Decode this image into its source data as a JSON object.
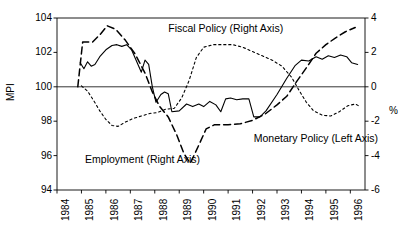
{
  "chart_data": {
    "type": "line",
    "title": "",
    "xlabel": "",
    "ylabel_left": "MPI",
    "ylabel_right": "%",
    "grid": false,
    "zero_reference_line": 100,
    "legend_position": "inline-annotations",
    "x": [
      1984,
      1985,
      1986,
      1987,
      1988,
      1989,
      1990,
      1991,
      1992,
      1993,
      1994,
      1995,
      1996
    ],
    "xtick_labels": [
      "1984",
      "1985",
      "1986",
      "1987",
      "1988",
      "1989",
      "1990",
      "1991",
      "1992",
      "1993",
      "1994",
      "1995",
      "1996"
    ],
    "left_axis": {
      "label": "MPI",
      "ylim": [
        94,
        104
      ],
      "ticks": [
        94,
        96,
        98,
        100,
        102,
        104
      ],
      "tick_labels": [
        "94",
        "96",
        "98",
        "100",
        "102",
        "104"
      ]
    },
    "right_axis": {
      "label": "%",
      "ylim": [
        -6,
        4
      ],
      "ticks": [
        -6,
        -4,
        -2,
        0,
        2,
        4
      ],
      "tick_labels": [
        "-6",
        "-4",
        "-2",
        "0",
        "2",
        "4"
      ]
    },
    "series": [
      {
        "name": "Monetary Policy (Left Axis)",
        "axis": "left",
        "style": "solid",
        "label_x": 1992.05,
        "label_y": 96.95,
        "points": [
          [
            1984.95,
            101.4
          ],
          [
            1985.1,
            101.05
          ],
          [
            1985.25,
            101.45
          ],
          [
            1985.4,
            101.2
          ],
          [
            1985.55,
            101.3
          ],
          [
            1985.75,
            101.75
          ],
          [
            1986.0,
            102.15
          ],
          [
            1986.25,
            102.4
          ],
          [
            1986.45,
            102.45
          ],
          [
            1986.65,
            102.35
          ],
          [
            1986.85,
            102.45
          ],
          [
            1987.05,
            102.15
          ],
          [
            1987.25,
            101.5
          ],
          [
            1987.45,
            100.85
          ],
          [
            1987.6,
            101.55
          ],
          [
            1987.75,
            101.3
          ],
          [
            1987.9,
            100.0
          ],
          [
            1988.05,
            99.1
          ],
          [
            1988.25,
            99.55
          ],
          [
            1988.4,
            99.7
          ],
          [
            1988.55,
            99.6
          ],
          [
            1988.7,
            98.55
          ],
          [
            1989.0,
            98.6
          ],
          [
            1989.3,
            99.0
          ],
          [
            1989.55,
            98.85
          ],
          [
            1989.8,
            99.0
          ],
          [
            1990.0,
            98.85
          ],
          [
            1990.25,
            99.15
          ],
          [
            1990.5,
            98.95
          ],
          [
            1990.7,
            98.55
          ],
          [
            1990.9,
            99.3
          ],
          [
            1991.1,
            99.35
          ],
          [
            1991.35,
            99.25
          ],
          [
            1991.6,
            99.3
          ],
          [
            1991.85,
            99.3
          ],
          [
            1992.05,
            98.25
          ],
          [
            1992.3,
            98.25
          ],
          [
            1992.55,
            98.6
          ],
          [
            1993.0,
            99.55
          ],
          [
            1993.4,
            100.5
          ],
          [
            1993.75,
            101.25
          ],
          [
            1994.0,
            101.55
          ],
          [
            1994.3,
            101.5
          ],
          [
            1994.6,
            101.75
          ],
          [
            1994.85,
            101.6
          ],
          [
            1995.1,
            101.8
          ],
          [
            1995.35,
            101.7
          ],
          [
            1995.6,
            101.85
          ],
          [
            1995.85,
            101.75
          ],
          [
            1996.05,
            101.4
          ],
          [
            1996.3,
            101.3
          ]
        ]
      },
      {
        "name": "Employment (Right Axis)",
        "axis": "right",
        "style": "dashed",
        "label_x": 1985.15,
        "label_y": 95.75,
        "points": [
          [
            1984.85,
            100.0
          ],
          [
            1985.05,
            102.6
          ],
          [
            1985.45,
            102.6
          ],
          [
            1985.8,
            103.1
          ],
          [
            1986.05,
            103.55
          ],
          [
            1986.4,
            103.35
          ],
          [
            1986.8,
            102.7
          ],
          [
            1987.2,
            101.9
          ],
          [
            1987.6,
            100.8
          ],
          [
            1987.9,
            99.7
          ],
          [
            1988.2,
            98.85
          ],
          [
            1988.55,
            98.25
          ],
          [
            1988.9,
            97.2
          ],
          [
            1989.2,
            96.1
          ],
          [
            1989.45,
            95.55
          ],
          [
            1989.8,
            96.6
          ],
          [
            1990.1,
            97.55
          ],
          [
            1990.45,
            97.8
          ],
          [
            1991.0,
            97.8
          ],
          [
            1991.5,
            97.85
          ],
          [
            1992.0,
            98.05
          ],
          [
            1992.5,
            98.4
          ],
          [
            1993.0,
            98.95
          ],
          [
            1993.4,
            99.45
          ],
          [
            1993.8,
            100.3
          ],
          [
            1994.2,
            101.1
          ],
          [
            1994.6,
            101.95
          ],
          [
            1995.0,
            102.45
          ],
          [
            1995.4,
            102.85
          ],
          [
            1995.8,
            103.2
          ],
          [
            1996.2,
            103.45
          ]
        ]
      },
      {
        "name": "Fiscal Policy (Right Axis)",
        "axis": "right",
        "style": "dotted",
        "label_x": 1988.55,
        "label_y": 103.35,
        "points": [
          [
            1985.0,
            100.05
          ],
          [
            1985.25,
            99.75
          ],
          [
            1985.5,
            99.2
          ],
          [
            1985.75,
            98.6
          ],
          [
            1986.0,
            98.1
          ],
          [
            1986.25,
            97.75
          ],
          [
            1986.5,
            97.7
          ],
          [
            1986.8,
            97.95
          ],
          [
            1987.1,
            98.15
          ],
          [
            1987.45,
            98.3
          ],
          [
            1987.8,
            98.45
          ],
          [
            1988.1,
            98.5
          ],
          [
            1988.45,
            98.7
          ],
          [
            1988.8,
            98.75
          ],
          [
            1989.1,
            99.35
          ],
          [
            1989.4,
            100.35
          ],
          [
            1989.7,
            101.7
          ],
          [
            1990.0,
            102.3
          ],
          [
            1990.4,
            102.45
          ],
          [
            1990.8,
            102.45
          ],
          [
            1991.2,
            102.45
          ],
          [
            1991.6,
            102.3
          ],
          [
            1992.0,
            102.05
          ],
          [
            1992.4,
            101.8
          ],
          [
            1992.8,
            101.55
          ],
          [
            1993.2,
            101.2
          ],
          [
            1993.6,
            100.55
          ],
          [
            1993.9,
            99.8
          ],
          [
            1994.2,
            99.1
          ],
          [
            1994.5,
            98.6
          ],
          [
            1994.85,
            98.35
          ],
          [
            1995.2,
            98.3
          ],
          [
            1995.55,
            98.55
          ],
          [
            1995.9,
            98.9
          ],
          [
            1996.2,
            99.0
          ],
          [
            1996.4,
            98.85
          ]
        ]
      }
    ]
  },
  "geometry": {
    "plot_left": 57,
    "plot_right": 365,
    "plot_top": 18,
    "plot_bottom": 190
  },
  "labels": {
    "y_left_title": "MPI",
    "y_right_title": "%"
  }
}
